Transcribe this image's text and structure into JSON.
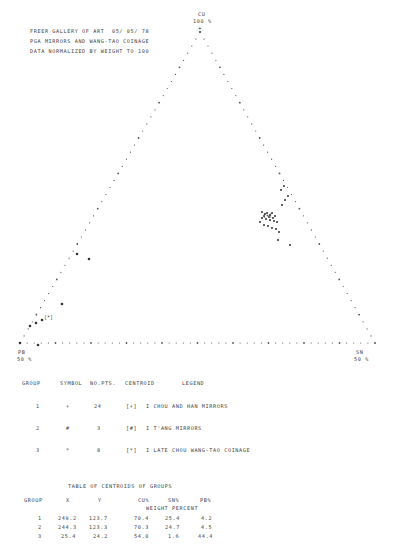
{
  "header": {
    "line1": "FREER GALLERY OF ART  05/ 05/ 78",
    "line2": "PGA MIRRORS AND WANG-TAO COINAGE",
    "line3": "DATA NORMALIZED BY WEIGHT TO 100"
  },
  "vertices": {
    "top": {
      "element": "CU",
      "pct": "100 %"
    },
    "left": {
      "element": "PB",
      "pct": "50 %"
    },
    "right": {
      "element": "SN",
      "pct": "50 %"
    }
  },
  "legend": {
    "headers": [
      "GROUP",
      "SYMBOL",
      "NO.PTS.",
      "CENTROID",
      "LEGEND"
    ],
    "rows": [
      {
        "group": "1",
        "symbol": "+",
        "npts": "24",
        "centroid": "[+]",
        "label": "I CHOU AND HAN MIRRORS"
      },
      {
        "group": "2",
        "symbol": "#",
        "npts": "3",
        "centroid": "[#]",
        "label": "I T'ANG MIRRORS"
      },
      {
        "group": "3",
        "symbol": "*",
        "npts": "8",
        "centroid": "[*]",
        "label": "I LATE CHOU WANG-TAO COINAGE"
      }
    ]
  },
  "centroid_table": {
    "title": "TABLE OF CENTROIDS OF GROUPS",
    "headers": [
      "GROUP",
      "X",
      "Y",
      "CU%",
      "SN%",
      "PB%"
    ],
    "subheader": "WEIGHT PERCENT",
    "rows": [
      {
        "group": "1",
        "x": "249.2",
        "y": "123.7",
        "cu": "70.4",
        "sn": "25.4",
        "pb": "4.2"
      },
      {
        "group": "2",
        "x": "244.3",
        "y": "123.3",
        "cu": "70.3",
        "sn": "24.7",
        "pb": "4.5"
      },
      {
        "group": "3",
        "x": "25.4",
        "y": "24.2",
        "cu": "54.0",
        "sn": "1.6",
        "pb": "44.4"
      }
    ]
  },
  "chart_data": {
    "type": "scatter",
    "subtype": "ternary",
    "axes": {
      "top": "CU 100%",
      "left": "PB 50%",
      "right": "SN 50%"
    },
    "series": [
      {
        "name": "CHOU AND HAN MIRRORS",
        "symbol": "+",
        "count": 24,
        "centroid": {
          "cu": 70.4,
          "sn": 25.4,
          "pb": 4.2
        },
        "points_px": [
          [
            262,
            212
          ],
          [
            265,
            214
          ],
          [
            267,
            213
          ],
          [
            270,
            215
          ],
          [
            272,
            213
          ],
          [
            275,
            216
          ],
          [
            262,
            218
          ],
          [
            266,
            219
          ],
          [
            270,
            220
          ],
          [
            274,
            221
          ],
          [
            277,
            222
          ],
          [
            260,
            222
          ],
          [
            264,
            225
          ],
          [
            268,
            226
          ],
          [
            272,
            228
          ],
          [
            276,
            229
          ],
          [
            279,
            232
          ],
          [
            282,
            205
          ],
          [
            285,
            200
          ],
          [
            288,
            196
          ],
          [
            278,
            240
          ],
          [
            290,
            245
          ],
          [
            284,
            186
          ],
          [
            281,
            190
          ]
        ]
      },
      {
        "name": "T'ANG MIRRORS",
        "symbol": "#",
        "count": 3,
        "centroid": {
          "cu": 70.3,
          "sn": 24.7,
          "pb": 4.5
        },
        "points_px": [
          [
            264,
            216
          ],
          [
            269,
            217
          ],
          [
            273,
            218
          ]
        ]
      },
      {
        "name": "LATE CHOU WANG-TAO COINAGE",
        "symbol": "*",
        "count": 8,
        "centroid": {
          "cu": 54.0,
          "sn": 1.6,
          "pb": 44.4
        },
        "points_px": [
          [
            77,
            254
          ],
          [
            89,
            259
          ],
          [
            62,
            304
          ],
          [
            42,
            320
          ],
          [
            36,
            323
          ],
          [
            30,
            326
          ],
          [
            38,
            345
          ],
          [
            20,
            343
          ]
        ]
      }
    ],
    "grid": false,
    "legend_position": "below"
  }
}
